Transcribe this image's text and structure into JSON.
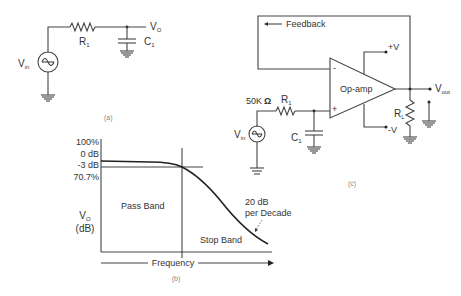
{
  "circuit_a": {
    "caption": "(a)",
    "vin_label": "V",
    "vin_sub": "in",
    "r_label": "R",
    "r_sub": "1",
    "c_label": "C",
    "c_sub": "1",
    "vo_label": "V",
    "vo_sub": "O"
  },
  "graph_b": {
    "caption": "(b)",
    "y_ticks": [
      "100%",
      "0 dB",
      "-3 dB",
      "70.7%"
    ],
    "y_label": "V",
    "y_label_sub": "O",
    "y_unit": "(dB)",
    "x_label": "Frequency",
    "pass_band": "Pass Band",
    "stop_band": "Stop Band",
    "slope_line1": "20 dB",
    "slope_line2": "per Decade"
  },
  "circuit_c": {
    "caption": "(c)",
    "feedback_label": "Feedback",
    "opamp_label": "Op-amp",
    "resistance": "50K",
    "ohm": "Ω",
    "r_label": "R",
    "r_sub": "1",
    "c_label": "C",
    "c_sub": "1",
    "vin_label": "V",
    "vin_sub": "in",
    "rl_label": "R",
    "rl_sub": "L",
    "vout_label": "V",
    "vout_sub": "out",
    "pos_supply": "+V",
    "neg_supply": "-V",
    "inv_input": "-",
    "noninv_input": "+"
  }
}
